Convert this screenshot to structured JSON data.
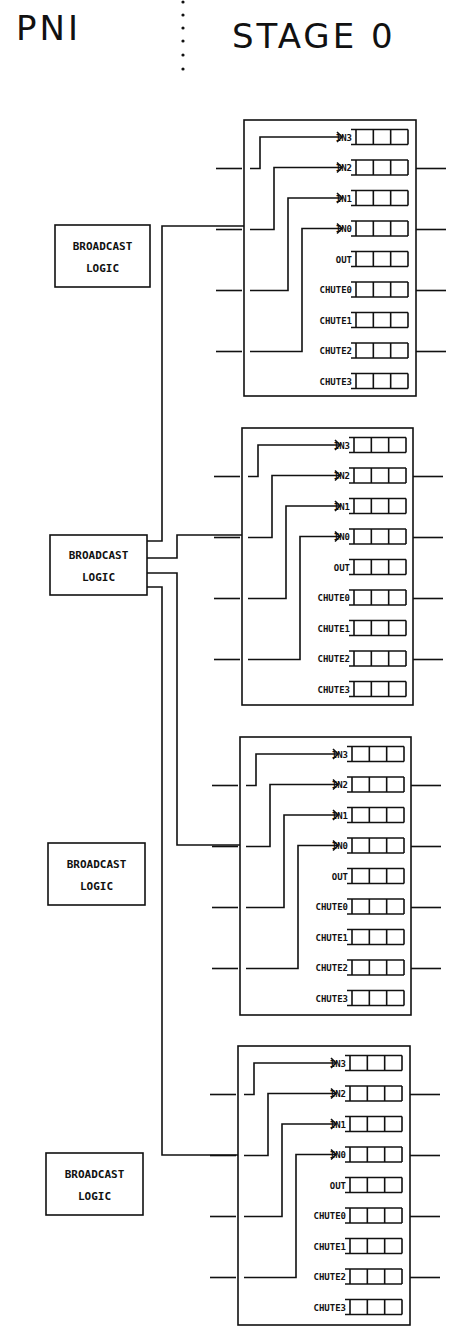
{
  "header": {
    "left_title": "PNI",
    "right_title": "STAGE 0"
  },
  "colors": {
    "ink": "#111111",
    "paper": "#ffffff"
  },
  "broadcast_logic": [
    {
      "line1": "BROADCAST",
      "line2": "LOGIC"
    },
    {
      "line1": "BROADCAST",
      "line2": "LOGIC"
    },
    {
      "line1": "BROADCAST",
      "line2": "LOGIC"
    },
    {
      "line1": "BROADCAST",
      "line2": "LOGIC"
    }
  ],
  "switch_nodes": [
    {
      "queues": [
        "IN3",
        "IN2",
        "IN1",
        "IN0",
        "OUT",
        "CHUTE0",
        "CHUTE1",
        "CHUTE2",
        "CHUTE3"
      ]
    },
    {
      "queues": [
        "IN3",
        "IN2",
        "IN1",
        "IN0",
        "OUT",
        "CHUTE0",
        "CHUTE1",
        "CHUTE2",
        "CHUTE3"
      ]
    },
    {
      "queues": [
        "IN3",
        "IN2",
        "IN1",
        "IN0",
        "OUT",
        "CHUTE0",
        "CHUTE1",
        "CHUTE2",
        "CHUTE3"
      ]
    },
    {
      "queues": [
        "IN3",
        "IN2",
        "IN1",
        "IN0",
        "OUT",
        "CHUTE0",
        "CHUTE1",
        "CHUTE2",
        "CHUTE3"
      ]
    }
  ],
  "queue_cells_per_row": 3
}
